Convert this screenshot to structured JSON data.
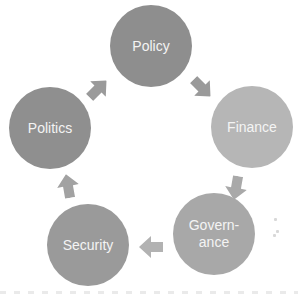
{
  "diagram": {
    "type": "cycle",
    "nodes": [
      {
        "id": "policy",
        "label": "Policy",
        "color": "#8e8e8e",
        "cx": 151,
        "cy": 46,
        "r": 41
      },
      {
        "id": "finance",
        "label": "Finance",
        "color": "#b6b6b6",
        "cx": 252,
        "cy": 127,
        "r": 41
      },
      {
        "id": "governance",
        "label": "Govern-\nance",
        "color": "#a8a8a8",
        "cx": 214,
        "cy": 234,
        "r": 41
      },
      {
        "id": "security",
        "label": "Security",
        "color": "#9a9a9a",
        "cx": 88,
        "cy": 245,
        "r": 41
      },
      {
        "id": "politics",
        "label": "Politics",
        "color": "#8f8f8f",
        "cx": 50,
        "cy": 128,
        "r": 41
      }
    ],
    "edges": [
      {
        "from": "politics",
        "to": "policy",
        "x": 98,
        "y": 89,
        "angle": -45,
        "color": "#9a9a9a"
      },
      {
        "from": "policy",
        "to": "finance",
        "x": 202,
        "y": 88,
        "angle": 45,
        "color": "#9a9a9a"
      },
      {
        "from": "finance",
        "to": "governance",
        "x": 236,
        "y": 188,
        "angle": 100,
        "color": "#a9a9a9"
      },
      {
        "from": "governance",
        "to": "security",
        "x": 151,
        "y": 247,
        "angle": 180,
        "color": "#b2b2b2"
      },
      {
        "from": "security",
        "to": "politics",
        "x": 68,
        "y": 186,
        "angle": -100,
        "color": "#a2a2a2"
      }
    ]
  }
}
